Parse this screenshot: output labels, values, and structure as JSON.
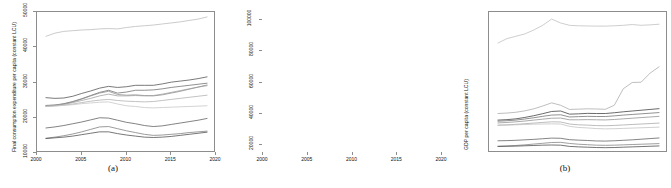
{
  "figure": {
    "panels": [
      {
        "id": "a",
        "caption": "(a)",
        "ylabel": "Final consumption expenditure per capita (constant LCU)",
        "xlabel": ""
      },
      {
        "id": "b",
        "caption": "(b)",
        "ylabel": "GDP per capita (constant LCU)",
        "xlabel": ""
      }
    ]
  },
  "chart_data": [
    {
      "type": "line",
      "panel": "a",
      "title": "",
      "xlabel": "",
      "ylabel": "Final consumption expenditure per capita (constant LCU)",
      "xlim": [
        2000,
        2020
      ],
      "ylim": [
        10000,
        50000
      ],
      "xticks": [
        2000,
        2005,
        2010,
        2015,
        2020
      ],
      "yticks": [
        10000,
        20000,
        30000,
        40000,
        50000
      ],
      "grid": false,
      "legend": null,
      "x": [
        2001,
        2002,
        2003,
        2004,
        2005,
        2006,
        2007,
        2008,
        2009,
        2010,
        2011,
        2012,
        2013,
        2014,
        2015,
        2016,
        2017,
        2018,
        2019
      ],
      "series": [
        {
          "name": "series-1",
          "color": "#b9b9b9",
          "values": [
            43100,
            44000,
            44500,
            44700,
            44900,
            45000,
            45200,
            45300,
            45200,
            45600,
            45900,
            46100,
            46300,
            46600,
            46900,
            47200,
            47600,
            48000,
            48600
          ]
        },
        {
          "name": "series-2",
          "color": "#4d4d4d",
          "values": [
            25700,
            25500,
            25600,
            26100,
            26900,
            27600,
            28400,
            28900,
            28600,
            28800,
            29200,
            29200,
            29200,
            29600,
            30100,
            30400,
            30700,
            31100,
            31600
          ]
        },
        {
          "name": "series-3",
          "color": "#6b6b6b",
          "values": [
            23500,
            23600,
            24000,
            24600,
            25400,
            26300,
            27200,
            27800,
            27000,
            27300,
            27800,
            27800,
            27900,
            28200,
            28600,
            28900,
            29200,
            29500,
            29800
          ]
        },
        {
          "name": "series-4",
          "color": "#8a8a8a",
          "values": [
            23300,
            23500,
            23900,
            24500,
            25300,
            26200,
            27000,
            27500,
            26600,
            26400,
            26500,
            26300,
            26200,
            26500,
            27000,
            27500,
            28100,
            28700,
            29300
          ]
        },
        {
          "name": "series-5",
          "color": "#9c9c9c",
          "values": [
            23400,
            23600,
            23800,
            24300,
            24900,
            25500,
            26200,
            26700,
            26200,
            26200,
            26300,
            26200,
            26300,
            26700,
            27200,
            27700,
            28200,
            28700,
            29100
          ]
        },
        {
          "name": "series-6",
          "color": "#adadad",
          "values": [
            23200,
            23400,
            23600,
            23900,
            24300,
            24700,
            25000,
            25200,
            24900,
            24700,
            24600,
            24500,
            24600,
            24900,
            25200,
            25500,
            25800,
            26100,
            26400
          ]
        },
        {
          "name": "series-7",
          "color": "#c4c4c4",
          "values": [
            23200,
            23300,
            23500,
            23700,
            24000,
            24200,
            24400,
            24500,
            23900,
            23400,
            23200,
            22900,
            22800,
            22900,
            23000,
            23100,
            23200,
            23300,
            23400
          ]
        },
        {
          "name": "series-8",
          "color": "#5a5a5a",
          "values": [
            17100,
            17400,
            17800,
            18300,
            18800,
            19400,
            20000,
            19900,
            19300,
            18700,
            18300,
            17800,
            17500,
            17700,
            18100,
            18500,
            18900,
            19300,
            19800
          ]
        },
        {
          "name": "series-9",
          "color": "#7a7a7a",
          "values": [
            14200,
            14500,
            14900,
            15400,
            16000,
            16700,
            17400,
            17500,
            16900,
            16300,
            15800,
            15300,
            15000,
            15100,
            15300,
            15500,
            15800,
            16000,
            16200
          ]
        },
        {
          "name": "series-10",
          "color": "#4a4a4a",
          "values": [
            14100,
            14300,
            14500,
            14800,
            15200,
            15600,
            16000,
            16000,
            15500,
            15100,
            14800,
            14500,
            14400,
            14500,
            14700,
            15000,
            15300,
            15600,
            15900
          ]
        }
      ]
    },
    {
      "type": "line",
      "panel": "b",
      "title": "",
      "xlabel": "",
      "ylabel": "GDP per capita (constant LCU)",
      "xlim": [
        2000,
        2020
      ],
      "ylim": [
        15000,
        105000
      ],
      "xticks": [
        2000,
        2005,
        2010,
        2015,
        2020
      ],
      "yticks": [
        20000,
        40000,
        60000,
        80000,
        100000
      ],
      "grid": false,
      "legend": null,
      "x": [
        2001,
        2002,
        2003,
        2004,
        2005,
        2006,
        2007,
        2008,
        2009,
        2010,
        2011,
        2012,
        2013,
        2014,
        2015,
        2016,
        2017,
        2018,
        2019
      ],
      "series": [
        {
          "name": "series-1",
          "color": "#bdbdbd",
          "values": [
            85200,
            88000,
            89500,
            91000,
            93500,
            96500,
            100500,
            98000,
            96500,
            96200,
            96100,
            96000,
            96000,
            96200,
            96500,
            97000,
            96500,
            96800,
            97200
          ]
        },
        {
          "name": "series-2",
          "color": "#a8a8a8",
          "values": [
            40200,
            40500,
            41000,
            41900,
            43200,
            45000,
            47000,
            45500,
            42800,
            43000,
            43200,
            43100,
            42900,
            45500,
            56000,
            60000,
            60200,
            66000,
            70000
          ]
        },
        {
          "name": "series-3",
          "color": "#3a3a3a",
          "values": [
            36000,
            36300,
            36800,
            37700,
            38800,
            40100,
            41500,
            41800,
            39800,
            40000,
            40300,
            40200,
            40200,
            40700,
            41300,
            41800,
            42300,
            42800,
            43300
          ]
        },
        {
          "name": "series-4",
          "color": "#6e6e6e",
          "values": [
            35300,
            35600,
            36000,
            36700,
            37500,
            38400,
            39200,
            39400,
            38000,
            38200,
            38400,
            38300,
            38300,
            38700,
            39200,
            39600,
            40000,
            40400,
            40800
          ]
        },
        {
          "name": "series-5",
          "color": "#8e8e8e",
          "values": [
            34200,
            34500,
            34900,
            35400,
            36000,
            36600,
            37200,
            37300,
            36200,
            36200,
            36300,
            36200,
            36100,
            36400,
            36800,
            37200,
            37600,
            38000,
            38400
          ]
        },
        {
          "name": "series-6",
          "color": "#a5a5a5",
          "values": [
            32800,
            33000,
            33300,
            33700,
            34100,
            34500,
            34900,
            34800,
            33500,
            33000,
            32800,
            32500,
            32400,
            32600,
            32900,
            33200,
            33500,
            33800,
            34100
          ]
        },
        {
          "name": "series-7",
          "color": "#c0c0c0",
          "values": [
            32600,
            32800,
            33000,
            33200,
            33400,
            33500,
            33600,
            33500,
            32000,
            31300,
            31000,
            30600,
            30400,
            30500,
            30700,
            30900,
            31100,
            31300,
            31500
          ]
        },
        {
          "name": "series-8",
          "color": "#5c5c5c",
          "values": [
            22800,
            22900,
            23100,
            23400,
            23700,
            24100,
            24500,
            24400,
            23500,
            23200,
            23000,
            22700,
            22600,
            22800,
            23100,
            23400,
            23800,
            24200,
            24600
          ]
        },
        {
          "name": "series-9",
          "color": "#7f7f7f",
          "values": [
            19300,
            19500,
            19800,
            20200,
            20700,
            21200,
            21700,
            21800,
            21100,
            20600,
            20300,
            20000,
            19900,
            20000,
            20200,
            20400,
            20600,
            20800,
            21000
          ]
        },
        {
          "name": "series-10",
          "color": "#454545",
          "values": [
            19200,
            19300,
            19400,
            19600,
            19800,
            20000,
            20100,
            20000,
            19200,
            18900,
            18700,
            18500,
            18400,
            18500,
            18700,
            18900,
            19100,
            19300,
            19500
          ]
        }
      ]
    }
  ]
}
